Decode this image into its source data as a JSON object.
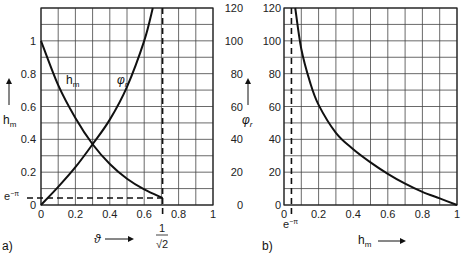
{
  "chart_data": [
    {
      "panel": "a)",
      "type": "line",
      "xlabel": "ϑ",
      "ylabel_left": "h_m",
      "ylabel_right": "φ_r",
      "xlim": [
        0,
        1
      ],
      "ylim_left": [
        0,
        1.2
      ],
      "ylim_right": [
        0,
        120
      ],
      "x_ticks": [
        "0",
        "0.2",
        "0.4",
        "0.6",
        "0.8",
        "1"
      ],
      "y_ticks_left": [
        "0",
        "0.2",
        "0.4",
        "0.6",
        "0.8",
        "1"
      ],
      "y_ticks_right": [
        "0",
        "20",
        "40",
        "60",
        "80",
        "100",
        "120"
      ],
      "grid": true,
      "annotations": [
        "e^-π",
        "1/√2"
      ],
      "series": [
        {
          "name": "h_m",
          "axis": "left",
          "x": [
            0,
            0.1,
            0.2,
            0.3,
            0.4,
            0.5,
            0.6,
            0.707
          ],
          "values": [
            1.0,
            0.73,
            0.53,
            0.37,
            0.25,
            0.16,
            0.095,
            0.043
          ]
        },
        {
          "name": "φ_r",
          "axis": "right",
          "x": [
            0,
            0.1,
            0.2,
            0.3,
            0.4,
            0.5,
            0.6,
            0.65
          ],
          "values": [
            0,
            11,
            23,
            37,
            52,
            72,
            100,
            120
          ]
        }
      ],
      "reference_lines": [
        {
          "orientation": "vertical",
          "x": 0.707,
          "label": "1/√2"
        },
        {
          "orientation": "horizontal",
          "y": 0.043,
          "label": "e^-π"
        }
      ]
    },
    {
      "panel": "b)",
      "type": "line",
      "xlabel": "h_m",
      "ylabel": "φ_r",
      "xlim": [
        0,
        1
      ],
      "ylim": [
        0,
        120
      ],
      "x_ticks": [
        "0",
        "0.2",
        "0.4",
        "0.6",
        "0.8",
        "1"
      ],
      "y_ticks": [
        "0",
        "20",
        "40",
        "60",
        "80",
        "100",
        "120"
      ],
      "grid": true,
      "annotations": [
        "e^-π"
      ],
      "series": [
        {
          "name": "φ_r",
          "x": [
            0.065,
            0.1,
            0.15,
            0.2,
            0.3,
            0.4,
            0.5,
            0.6,
            0.7,
            0.8,
            0.9,
            1.0
          ],
          "values": [
            120,
            95,
            75,
            61,
            44,
            34,
            26,
            19,
            13,
            8,
            4,
            0
          ]
        }
      ],
      "reference_lines": [
        {
          "orientation": "vertical",
          "x": 0.043,
          "label": "e^-π"
        }
      ]
    }
  ],
  "labels": {
    "panel_a": "a)",
    "panel_b": "b)",
    "a_xlabel": "ϑ",
    "a_ylabel_left": "h",
    "a_ylabel_left_sub": "m",
    "a_ylabel_right": "φ",
    "a_ylabel_right_sub": "r",
    "a_curve_hm": "h",
    "a_curve_hm_sub": "m",
    "a_curve_phi": "φ",
    "a_curve_phi_sub": "r",
    "a_emp": "e",
    "a_emp_sup": "−π",
    "a_sqrt_num": "1",
    "a_sqrt_den": "√2",
    "b_xlabel": "h",
    "b_xlabel_sub": "m",
    "b_emp": "e",
    "b_emp_sup": "−π"
  }
}
